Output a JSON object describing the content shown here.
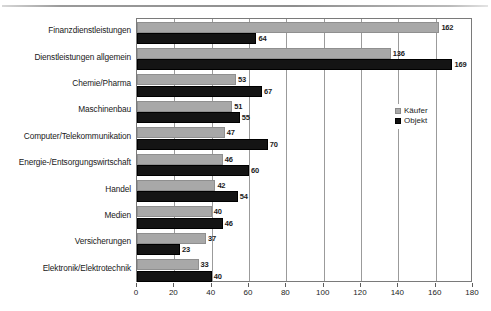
{
  "chart_data": {
    "type": "bar",
    "orientation": "horizontal",
    "title": "",
    "xlabel": "",
    "ylabel": "",
    "xlim": [
      0,
      180
    ],
    "xticks": [
      0,
      20,
      40,
      60,
      80,
      100,
      120,
      140,
      160,
      180
    ],
    "grid": true,
    "legend_position": "inside-right",
    "categories": [
      "Finanzdienstleistungen",
      "Dienstleistungen allgemein",
      "Chemie/Pharma",
      "Maschinenbau",
      "Computer/Telekommunikation",
      "Energie-/Entsorgungswirtschaft",
      "Handel",
      "Medien",
      "Versicherungen",
      "Elektronik/Elektrotechnik"
    ],
    "series": [
      {
        "name": "Käufer",
        "color": "#a8a8a8",
        "values": [
          162,
          136,
          53,
          51,
          47,
          46,
          42,
          40,
          37,
          33
        ]
      },
      {
        "name": "Objekt",
        "color": "#141414",
        "values": [
          64,
          169,
          67,
          55,
          70,
          60,
          54,
          46,
          23,
          40
        ]
      }
    ]
  },
  "legend": {
    "items": [
      {
        "label": "Käufer",
        "swatch": "kaeufer"
      },
      {
        "label": "Objekt",
        "swatch": "objekt"
      }
    ]
  }
}
